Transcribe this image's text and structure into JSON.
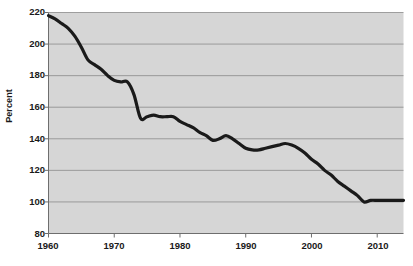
{
  "chart_data": {
    "type": "line",
    "title": "",
    "xlabel": "",
    "ylabel": "Percent",
    "xlim": [
      1960,
      2014
    ],
    "ylim": [
      80,
      220
    ],
    "grid": true,
    "legend": false,
    "y_ticks": [
      220,
      200,
      180,
      160,
      140,
      120,
      100,
      80
    ],
    "x_ticks": [
      1960,
      1970,
      1980,
      1990,
      2000,
      2010
    ],
    "series": [
      {
        "name": "Percent",
        "color": "#1a1a1a",
        "x": [
          1960,
          1961,
          1962,
          1963,
          1964,
          1965,
          1966,
          1967,
          1968,
          1969,
          1970,
          1971,
          1972,
          1973,
          1974,
          1975,
          1976,
          1977,
          1978,
          1979,
          1980,
          1981,
          1982,
          1983,
          1984,
          1985,
          1986,
          1987,
          1988,
          1989,
          1990,
          1991,
          1992,
          1993,
          1994,
          1995,
          1996,
          1997,
          1998,
          1999,
          2000,
          2001,
          2002,
          2003,
          2004,
          2005,
          2006,
          2007,
          2008,
          2009,
          2010,
          2011,
          2012,
          2013,
          2014
        ],
        "values": [
          218,
          216,
          213,
          210,
          205,
          198,
          190,
          187,
          184,
          180,
          177,
          176,
          176,
          168,
          153,
          154,
          155,
          154,
          154,
          154,
          151,
          149,
          147,
          144,
          142,
          139,
          140,
          142,
          140,
          137,
          134,
          133,
          133,
          134,
          135,
          136,
          137,
          136,
          134,
          131,
          127,
          124,
          120,
          117,
          113,
          110,
          107,
          104,
          100,
          101,
          101,
          101,
          101,
          101,
          101
        ]
      }
    ]
  },
  "axes": {
    "y_title": "Percent",
    "y_tick_labels": [
      "220",
      "200",
      "180",
      "160",
      "140",
      "120",
      "100",
      "80"
    ],
    "x_tick_labels": [
      "1960",
      "1970",
      "1980",
      "1990",
      "2000",
      "2010"
    ]
  },
  "style": {
    "plot_background": "#d6d6d6",
    "grid_color": "#8a8a8a",
    "axis_color": "#6e6e6e",
    "line_color": "#1a1a1a",
    "text_color": "#1a1a1a",
    "page_background": "#ffffff"
  }
}
